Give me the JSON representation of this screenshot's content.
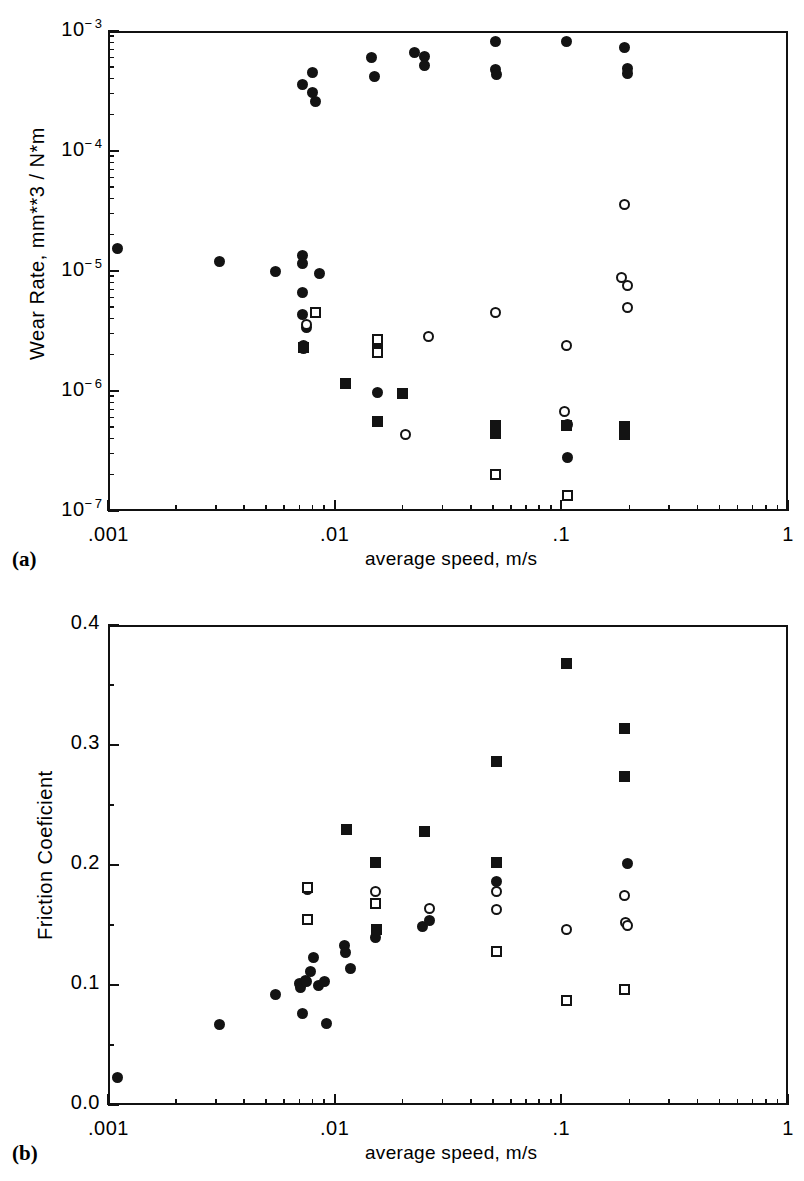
{
  "figure": {
    "panels": [
      {
        "id": "a",
        "label": "(a)",
        "xlabel": "average speed, m/s",
        "ylabel": "Wear Rate,  mm**3 / N*m",
        "xticklabels": [
          ".001",
          ".01",
          ".1",
          "1"
        ],
        "yticklabels": [
          "10-7",
          "10-6",
          "10-5",
          "10-4",
          "10-3"
        ]
      },
      {
        "id": "b",
        "label": "(b)",
        "xlabel": "average speed, m/s",
        "ylabel": "Friction  Coeficient",
        "xticklabels": [
          ".001",
          ".01",
          ".1",
          "1"
        ],
        "yticklabels": [
          "0.0",
          "0.1",
          "0.2",
          "0.3",
          "0.4"
        ]
      }
    ]
  },
  "chart_data": [
    {
      "type": "scatter",
      "panel": "a",
      "title": "",
      "xlabel": "average speed, m/s",
      "ylabel": "Wear Rate,  mm**3 / N*m",
      "xscale": "log",
      "yscale": "log",
      "xlim": [
        0.001,
        1
      ],
      "ylim": [
        1e-07,
        0.001
      ],
      "xticks": [
        0.001,
        0.01,
        0.1,
        1
      ],
      "xticklabels": [
        ".001",
        ".01",
        ".1",
        "1"
      ],
      "yticks": [
        1e-07,
        1e-06,
        1e-05,
        0.0001,
        0.001
      ],
      "yticklabels": [
        "10-7",
        "10-6",
        "10-5",
        "10-4",
        "10-3"
      ],
      "grid": false,
      "legend": "none",
      "series": [
        {
          "name": "filled-circle",
          "marker": "filled-circle",
          "points": [
            [
              0.0011,
              1.55e-05
            ],
            [
              0.0031,
              1.2e-05
            ],
            [
              0.0055,
              1e-05
            ],
            [
              0.0072,
              1.35e-05
            ],
            [
              0.0072,
              1.15e-05
            ],
            [
              0.0072,
              6.6e-06
            ],
            [
              0.0072,
              4.3e-06
            ],
            [
              0.0075,
              3.4e-06
            ],
            [
              0.0073,
              2.4e-06
            ],
            [
              0.0073,
              2.25e-06
            ],
            [
              0.0086,
              9.6e-06
            ],
            [
              0.0072,
              0.00036
            ],
            [
              0.008,
              0.00031
            ],
            [
              0.008,
              0.00045
            ],
            [
              0.0082,
              0.00026
            ],
            [
              0.0112,
              1.15e-06
            ],
            [
              0.0145,
              0.0006
            ],
            [
              0.015,
              0.00042
            ],
            [
              0.0155,
              9.8e-07
            ],
            [
              0.0225,
              0.00066
            ],
            [
              0.025,
              0.00061
            ],
            [
              0.025,
              0.00052
            ],
            [
              0.051,
              0.00081
            ],
            [
              0.051,
              0.00048
            ],
            [
              0.052,
              0.00043
            ],
            [
              0.105,
              0.00082
            ],
            [
              0.106,
              2.8e-07
            ],
            [
              0.19,
              0.00073
            ],
            [
              0.195,
              0.00049
            ],
            [
              0.195,
              0.00044
            ]
          ]
        },
        {
          "name": "open-circle",
          "marker": "open-circle",
          "points": [
            [
              0.0075,
              3.6e-06
            ],
            [
              0.0155,
              2.55e-06
            ],
            [
              0.0205,
              4.3e-07
            ],
            [
              0.026,
              2.85e-06
            ],
            [
              0.051,
              4.5e-06
            ],
            [
              0.103,
              6.8e-07
            ],
            [
              0.106,
              5.3e-07
            ],
            [
              0.19,
              3.6e-05
            ],
            [
              0.185,
              8.9e-06
            ],
            [
              0.196,
              7.6e-06
            ],
            [
              0.196,
              5e-06
            ],
            [
              0.105,
              2.4e-06
            ]
          ]
        },
        {
          "name": "filled-square",
          "marker": "filled-square",
          "points": [
            [
              0.0073,
              2.3e-06
            ],
            [
              0.0112,
              1.15e-06
            ],
            [
              0.0155,
              2.3e-06
            ],
            [
              0.0155,
              5.6e-07
            ],
            [
              0.02,
              9.6e-07
            ],
            [
              0.051,
              5.2e-07
            ],
            [
              0.051,
              4.4e-07
            ],
            [
              0.105,
              5.2e-07
            ],
            [
              0.19,
              5.1e-07
            ],
            [
              0.19,
              4.3e-07
            ]
          ]
        },
        {
          "name": "open-square",
          "marker": "open-square",
          "points": [
            [
              0.0082,
              4.5e-06
            ],
            [
              0.0155,
              2.7e-06
            ],
            [
              0.0155,
              2.1e-06
            ],
            [
              0.051,
              2e-07
            ],
            [
              0.106,
              1.35e-07
            ]
          ]
        }
      ]
    },
    {
      "type": "scatter",
      "panel": "b",
      "title": "",
      "xlabel": "average speed, m/s",
      "ylabel": "Friction  Coeficient",
      "xscale": "log",
      "yscale": "linear",
      "xlim": [
        0.001,
        1
      ],
      "ylim": [
        0.0,
        0.4
      ],
      "xticks": [
        0.001,
        0.01,
        0.1,
        1
      ],
      "xticklabels": [
        ".001",
        ".01",
        ".1",
        "1"
      ],
      "yticks": [
        0.0,
        0.1,
        0.2,
        0.3,
        0.4
      ],
      "yticklabels": [
        "0.0",
        "0.1",
        "0.2",
        "0.3",
        "0.4"
      ],
      "grid": false,
      "legend": "none",
      "series": [
        {
          "name": "filled-circle",
          "marker": "filled-circle",
          "points": [
            [
              0.0011,
              0.023
            ],
            [
              0.0031,
              0.067
            ],
            [
              0.0055,
              0.092
            ],
            [
              0.007,
              0.101
            ],
            [
              0.0071,
              0.098
            ],
            [
              0.0074,
              0.104
            ],
            [
              0.0075,
              0.103
            ],
            [
              0.0072,
              0.076
            ],
            [
              0.0078,
              0.111
            ],
            [
              0.0081,
              0.123
            ],
            [
              0.0085,
              0.1
            ],
            [
              0.009,
              0.103
            ],
            [
              0.0092,
              0.068
            ],
            [
              0.011,
              0.133
            ],
            [
              0.0112,
              0.127
            ],
            [
              0.0118,
              0.114
            ],
            [
              0.0152,
              0.14
            ],
            [
              0.0153,
              0.146
            ],
            [
              0.0245,
              0.149
            ],
            [
              0.0262,
              0.154
            ],
            [
              0.052,
              0.186
            ],
            [
              0.195,
              0.201
            ]
          ]
        },
        {
          "name": "open-circle",
          "marker": "open-circle",
          "points": [
            [
              0.0076,
              0.18
            ],
            [
              0.0152,
              0.178
            ],
            [
              0.0262,
              0.164
            ],
            [
              0.052,
              0.178
            ],
            [
              0.052,
              0.163
            ],
            [
              0.105,
              0.146
            ],
            [
              0.19,
              0.175
            ],
            [
              0.192,
              0.152
            ],
            [
              0.196,
              0.15
            ]
          ]
        },
        {
          "name": "filled-square",
          "marker": "filled-square",
          "points": [
            [
              0.0113,
              0.23
            ],
            [
              0.0152,
              0.202
            ],
            [
              0.0153,
              0.146
            ],
            [
              0.025,
              0.228
            ],
            [
              0.052,
              0.286
            ],
            [
              0.052,
              0.202
            ],
            [
              0.105,
              0.368
            ],
            [
              0.19,
              0.314
            ],
            [
              0.19,
              0.274
            ]
          ]
        },
        {
          "name": "open-square",
          "marker": "open-square",
          "points": [
            [
              0.0076,
              0.181
            ],
            [
              0.0076,
              0.155
            ],
            [
              0.0152,
              0.168
            ],
            [
              0.052,
              0.128
            ],
            [
              0.105,
              0.087
            ],
            [
              0.19,
              0.096
            ]
          ]
        }
      ]
    }
  ]
}
